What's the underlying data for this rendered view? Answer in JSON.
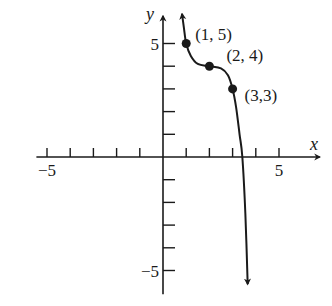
{
  "chart_data": {
    "type": "line",
    "title": "",
    "xlabel": "x",
    "ylabel": "y",
    "xlim": [
      -5.5,
      6.5
    ],
    "ylim": [
      -6,
      6.3
    ],
    "grid": false,
    "x_ticks": [
      -5,
      -4,
      -3,
      -2,
      -1,
      1,
      2,
      3,
      4,
      5
    ],
    "y_ticks": [
      -5,
      -4,
      -3,
      -2,
      -1,
      1,
      2,
      3,
      4,
      5
    ],
    "x_tick_labels": [
      {
        "value": -5,
        "text": "−5"
      },
      {
        "value": 5,
        "text": "5"
      }
    ],
    "y_tick_labels": [
      {
        "value": 5,
        "text": "5"
      },
      {
        "value": -5,
        "text": "−5"
      }
    ],
    "series": [
      {
        "name": "f(x)",
        "arrows": "both-ends",
        "x": [
          0.82,
          0.9,
          1,
          1.2,
          1.5,
          2,
          2.5,
          2.8,
          3,
          3.15,
          3.3,
          3.42,
          3.55,
          3.65
        ],
        "y": [
          6.3,
          5.7,
          5,
          4.45,
          4.1,
          4,
          3.9,
          3.6,
          3,
          2.2,
          1.0,
          0,
          -2.5,
          -5.6
        ]
      }
    ],
    "points": [
      {
        "x": 1,
        "y": 5,
        "label": "(1, 5)"
      },
      {
        "x": 2,
        "y": 4,
        "label": "(2, 4)"
      },
      {
        "x": 3,
        "y": 3,
        "label": "(3,3)"
      }
    ]
  }
}
